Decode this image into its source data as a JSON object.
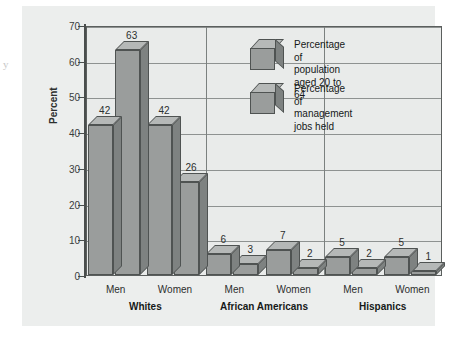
{
  "figure": {
    "scan_artifact": "y",
    "axis_title": "Percent"
  },
  "chart_data": {
    "type": "bar",
    "title": "",
    "xlabel": "",
    "ylabel": "Percent",
    "ylim": [
      0,
      70
    ],
    "yticks": [
      0,
      10,
      20,
      30,
      40,
      50,
      60,
      70
    ],
    "grid": true,
    "legend_position": "inside-top-right",
    "categories": [
      "Men",
      "Women",
      "Men",
      "Women",
      "Men",
      "Women"
    ],
    "groups": [
      {
        "name": "Whites",
        "categories": [
          "Men",
          "Women"
        ]
      },
      {
        "name": "African Americans",
        "categories": [
          "Men",
          "Women"
        ]
      },
      {
        "name": "Hispanics",
        "categories": [
          "Men",
          "Women"
        ]
      }
    ],
    "series": [
      {
        "name": "Percentage of population aged 20 to 64",
        "values": [
          42,
          42,
          6,
          7,
          5,
          5
        ]
      },
      {
        "name": "Percentage of management jobs held",
        "values": [
          63,
          26,
          3,
          2,
          2,
          1
        ]
      }
    ],
    "bars": [
      {
        "group": "Whites",
        "category": "Men",
        "series": "Percentage of population aged 20 to 64",
        "value": 42
      },
      {
        "group": "Whites",
        "category": "Men",
        "series": "Percentage of management jobs held",
        "value": 63
      },
      {
        "group": "Whites",
        "category": "Women",
        "series": "Percentage of population aged 20 to 64",
        "value": 42
      },
      {
        "group": "Whites",
        "category": "Women",
        "series": "Percentage of management jobs held",
        "value": 26
      },
      {
        "group": "African Americans",
        "category": "Men",
        "series": "Percentage of population aged 20 to 64",
        "value": 6
      },
      {
        "group": "African Americans",
        "category": "Men",
        "series": "Percentage of management jobs held",
        "value": 3
      },
      {
        "group": "African Americans",
        "category": "Women",
        "series": "Percentage of population aged 20 to 64",
        "value": 7
      },
      {
        "group": "African Americans",
        "category": "Women",
        "series": "Percentage of management jobs held",
        "value": 2
      },
      {
        "group": "Hispanics",
        "category": "Men",
        "series": "Percentage of population aged 20 to 64",
        "value": 5
      },
      {
        "group": "Hispanics",
        "category": "Men",
        "series": "Percentage of management jobs held",
        "value": 2
      },
      {
        "group": "Hispanics",
        "category": "Women",
        "series": "Percentage of population aged 20 to 64",
        "value": 5
      },
      {
        "group": "Hispanics",
        "category": "Women",
        "series": "Percentage of management jobs held",
        "value": 1
      }
    ],
    "legend": [
      {
        "label": "Percentage of population\naged 20 to 64",
        "icon": "cube-3d-icon"
      },
      {
        "label": "Percentage of management\njobs held",
        "icon": "cube-3d-icon"
      }
    ],
    "colors": {
      "bar_front": "#9a9d9c",
      "bar_top": "#b5b8b7",
      "bar_side": "#7e8281",
      "bar_outline": "#4f5352",
      "panel_bg": "#eceeed",
      "plot_bg": "#e9ebea",
      "gridline": "#8e9291",
      "axis": "#4a4e4d",
      "text": "#161918"
    }
  }
}
